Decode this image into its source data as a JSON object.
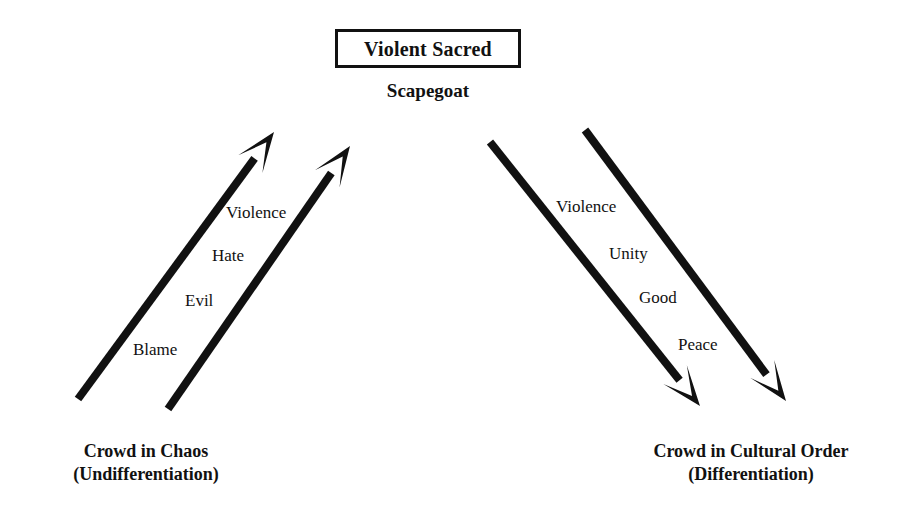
{
  "diagram": {
    "apex": {
      "boxed_title": "Violent Sacred",
      "subtitle": "Scapegoat"
    },
    "left_group": {
      "caption_line1": "Crowd in Chaos",
      "caption_line2": "(Undifferentiation)",
      "stages": [
        {
          "label": "Violence",
          "x": 226,
          "y": 204
        },
        {
          "label": "Hate",
          "x": 212,
          "y": 247
        },
        {
          "label": "Evil",
          "x": 185,
          "y": 292
        },
        {
          "label": "Blame",
          "x": 133,
          "y": 341
        }
      ],
      "arrows": [
        {
          "name": "left-outer-arrow-up",
          "x1": 78,
          "y1": 399,
          "x2": 274,
          "y2": 132
        },
        {
          "name": "left-inner-arrow-up",
          "x1": 168,
          "y1": 409,
          "x2": 350,
          "y2": 146
        }
      ]
    },
    "right_group": {
      "caption_line1": "Crowd in Cultural Order",
      "caption_line2": "(Differentiation)",
      "stages": [
        {
          "label": "Violence",
          "x": 556,
          "y": 198
        },
        {
          "label": "Unity",
          "x": 609,
          "y": 245
        },
        {
          "label": "Good",
          "x": 639,
          "y": 289
        },
        {
          "label": "Peace",
          "x": 678,
          "y": 336
        }
      ],
      "arrows": [
        {
          "name": "right-inner-arrow-down",
          "x1": 490,
          "y1": 142,
          "x2": 700,
          "y2": 406
        },
        {
          "name": "right-outer-arrow-down",
          "x1": 585,
          "y1": 130,
          "x2": 786,
          "y2": 401
        }
      ]
    },
    "style": {
      "ink_color": "#111111",
      "background_color": "#ffffff",
      "stroke_width": 8,
      "arrowhead_length": 40,
      "arrowhead_half_width": 15,
      "arrowhead_notch": 0.32
    }
  }
}
